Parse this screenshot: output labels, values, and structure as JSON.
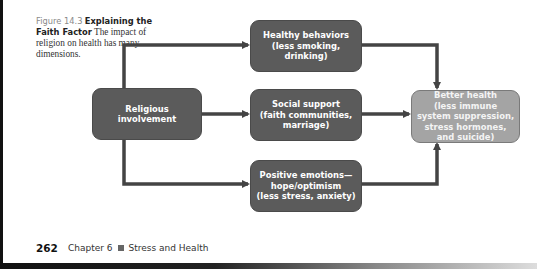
{
  "caption": {
    "figure_number": "Figure 14.3",
    "title": "Explaining the Faith Factor",
    "text": "The impact of religion on health has many dimensions."
  },
  "diagram": {
    "source": {
      "label": "Religious involvement"
    },
    "mediators": [
      {
        "title": "Healthy behaviors",
        "detail": "(less smoking, drinking)"
      },
      {
        "title": "Social support",
        "detail": "(faith communities, marriage)"
      },
      {
        "title": "Positive emotions—hope/optimism",
        "detail": "(less stress, anxiety)"
      }
    ],
    "outcome": {
      "title": "Better health",
      "detail": "(less immune system suppression, stress hormones, and suicide)"
    },
    "colors": {
      "dark_box": "#5b5b5b",
      "light_box": "#a4a4a4",
      "arrow": "#444444"
    }
  },
  "footer": {
    "page_number": "262",
    "chapter": "Chapter 6",
    "section": "Stress and Health"
  }
}
